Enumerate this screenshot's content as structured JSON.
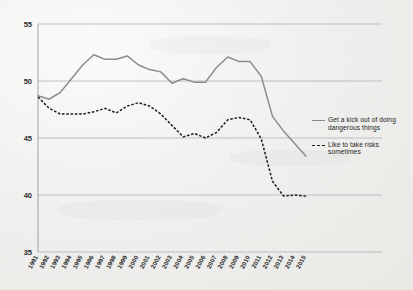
{
  "chart_data": {
    "type": "line",
    "title": "",
    "subtitle": "",
    "xlabel": "",
    "ylabel": "",
    "xlim": [
      1991,
      2015
    ],
    "ylim": [
      35,
      55
    ],
    "yticks": [
      35,
      40,
      45,
      50,
      55
    ],
    "grid": true,
    "legend_position": "right",
    "x": [
      1991,
      1992,
      1993,
      1994,
      1995,
      1996,
      1997,
      1998,
      1999,
      2000,
      2001,
      2002,
      2003,
      2004,
      2005,
      2006,
      2007,
      2008,
      2009,
      2010,
      2011,
      2012,
      2013,
      2014,
      2015
    ],
    "categories": [
      "1991",
      "1992",
      "1993",
      "1994",
      "1995",
      "1996",
      "1997",
      "1998",
      "1999",
      "2000",
      "2001",
      "2002",
      "2003",
      "2004",
      "2005",
      "2006",
      "2007",
      "2008",
      "2009",
      "2010",
      "2011",
      "2012",
      "2013",
      "2014",
      "2015"
    ],
    "series": [
      {
        "name": "Get a kick out of doing dangerous things",
        "style": "solid",
        "color": "#8a8c90",
        "values": [
          48.7,
          48.4,
          49.0,
          50.2,
          51.4,
          52.3,
          51.9,
          51.9,
          52.2,
          51.4,
          51.0,
          50.8,
          49.8,
          50.2,
          49.9,
          49.9,
          51.2,
          52.1,
          51.7,
          51.7,
          50.4,
          46.9,
          45.6,
          44.5,
          43.4
        ]
      },
      {
        "name": "Like to take risks sometimes",
        "style": "dashed",
        "color": "#1d1d1d",
        "values": [
          48.6,
          47.6,
          47.1,
          47.1,
          47.1,
          47.3,
          47.6,
          47.2,
          47.8,
          48.1,
          47.8,
          47.1,
          46.1,
          45.1,
          45.4,
          45.0,
          45.5,
          46.6,
          46.8,
          46.6,
          44.9,
          41.2,
          39.9,
          40.0,
          39.9
        ]
      }
    ]
  },
  "legend": {
    "items": [
      {
        "label": "Get a kick out of doing dangerous things",
        "style": "solid"
      },
      {
        "label": "Like to take risks sometimes",
        "style": "dashed"
      }
    ]
  }
}
